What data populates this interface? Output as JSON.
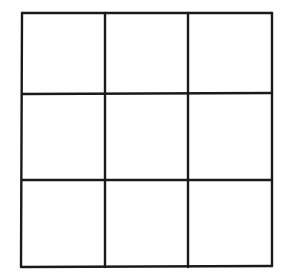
{
  "diagram": {
    "type": "grid",
    "rows": 3,
    "cols": 3,
    "cells": [
      "",
      "",
      "",
      "",
      "",
      "",
      "",
      "",
      ""
    ],
    "line_color": "#1a1a1a",
    "background": "#ffffff"
  }
}
